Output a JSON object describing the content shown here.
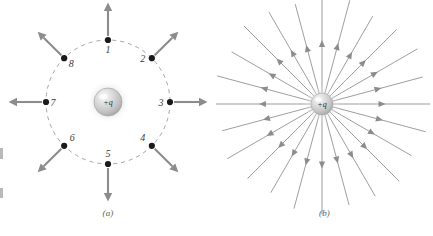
{
  "figure": {
    "background_color": "#ffffff",
    "width": 433,
    "height": 236
  },
  "style": {
    "arrow_color": "#8c8c8c",
    "dashed_circle_color": "#9a9a9a",
    "point_dot_color": "#1a1a1a",
    "field_line_color": "#8c8c8c",
    "label_color": "#3b3b3b",
    "caption_color": "#5d5d5d",
    "sphere_highlight_color": "#f2f2f2",
    "sphere_mid_color": "#c9c9c9",
    "sphere_edge_color": "#a0a0a0"
  },
  "panel_a": {
    "caption": "(a)",
    "charge_label": "+q",
    "center": {
      "x": 108,
      "y": 102
    },
    "charge_radius": 14,
    "dashed_circle_radius": 62,
    "dash_pattern": "4 4",
    "arrow_length": 32,
    "arrow_gap": 4,
    "points": [
      {
        "number": "1",
        "angle_deg": 90,
        "label_dx": 0,
        "label_dy": 13
      },
      {
        "number": "2",
        "angle_deg": 45,
        "label_dx": -9,
        "label_dy": 4
      },
      {
        "number": "3",
        "angle_deg": 0,
        "label_dx": -9,
        "label_dy": 4
      },
      {
        "number": "4",
        "angle_deg": -45,
        "label_dx": -9,
        "label_dy": -5
      },
      {
        "number": "5",
        "angle_deg": -90,
        "label_dx": 0,
        "label_dy": -7
      },
      {
        "number": "6",
        "angle_deg": -135,
        "label_dx": 8,
        "label_dy": -5
      },
      {
        "number": "7",
        "angle_deg": 180,
        "label_dx": 7,
        "label_dy": 4
      },
      {
        "number": "8",
        "angle_deg": 135,
        "label_dx": 7,
        "label_dy": 9
      }
    ]
  },
  "panel_b": {
    "caption": "(b)",
    "charge_label": "+q",
    "center": {
      "x": 106,
      "y": 104
    },
    "charge_radius": 11,
    "field_line_count": 24,
    "field_line_angle_step_deg": 15,
    "field_line_inner_radius": 9,
    "field_line_lengths": [
      99,
      95,
      101,
      96,
      92,
      98,
      100,
      94,
      97,
      101,
      95,
      99,
      98,
      94,
      100,
      96,
      93,
      99,
      101,
      95,
      97,
      100,
      94,
      98
    ],
    "arrowhead_position_fraction": 0.48
  }
}
